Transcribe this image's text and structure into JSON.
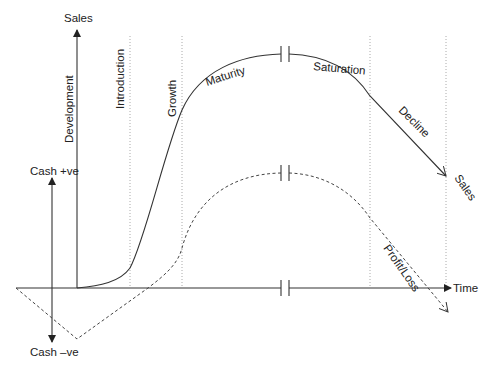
{
  "diagram": {
    "axes": {
      "sales_axis_label": "Sales",
      "time_axis_label": "Time",
      "cash_positive_label": "Cash +ve",
      "cash_negative_label": "Cash –ve"
    },
    "stages": [
      {
        "label": "Development"
      },
      {
        "label": "Introduction"
      },
      {
        "label": "Growth"
      },
      {
        "label": "Maturity"
      },
      {
        "label": "Saturation"
      },
      {
        "label": "Decline"
      }
    ],
    "curves": {
      "sales_label": "Sales",
      "profit_label": "Profit/Loss"
    },
    "colors": {
      "line": "#333333",
      "guide": "#aaaaaa",
      "background": "#ffffff"
    }
  }
}
